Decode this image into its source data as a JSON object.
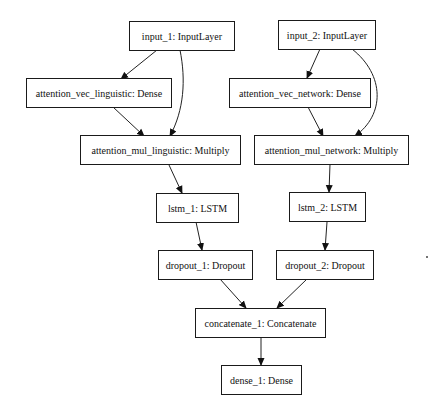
{
  "diagram": {
    "nodes": [
      {
        "id": "input_1",
        "label": "input_1: InputLayer"
      },
      {
        "id": "input_2",
        "label": "input_2: InputLayer"
      },
      {
        "id": "attention_vec_linguistic",
        "label": "attention_vec_linguistic: Dense"
      },
      {
        "id": "attention_vec_network",
        "label": "attention_vec_network: Dense"
      },
      {
        "id": "attention_mul_linguistic",
        "label": "attention_mul_linguistic: Multiply"
      },
      {
        "id": "attention_mul_network",
        "label": "attention_mul_network: Multiply"
      },
      {
        "id": "lstm_1",
        "label": "lstm_1: LSTM"
      },
      {
        "id": "lstm_2",
        "label": "lstm_2: LSTM"
      },
      {
        "id": "dropout_1",
        "label": "dropout_1: Dropout"
      },
      {
        "id": "dropout_2",
        "label": "dropout_2: Dropout"
      },
      {
        "id": "concatenate_1",
        "label": "concatenate_1: Concatenate"
      },
      {
        "id": "dense_1",
        "label": "dense_1: Dense"
      }
    ],
    "edges": [
      {
        "from": "input_1",
        "to": "attention_vec_linguistic"
      },
      {
        "from": "input_1",
        "to": "attention_mul_linguistic"
      },
      {
        "from": "attention_vec_linguistic",
        "to": "attention_mul_linguistic"
      },
      {
        "from": "input_2",
        "to": "attention_vec_network"
      },
      {
        "from": "input_2",
        "to": "attention_mul_network"
      },
      {
        "from": "attention_vec_network",
        "to": "attention_mul_network"
      },
      {
        "from": "attention_mul_linguistic",
        "to": "lstm_1"
      },
      {
        "from": "attention_mul_network",
        "to": "lstm_2"
      },
      {
        "from": "lstm_1",
        "to": "dropout_1"
      },
      {
        "from": "lstm_2",
        "to": "dropout_2"
      },
      {
        "from": "dropout_1",
        "to": "concatenate_1"
      },
      {
        "from": "dropout_2",
        "to": "concatenate_1"
      },
      {
        "from": "concatenate_1",
        "to": "dense_1"
      }
    ]
  }
}
